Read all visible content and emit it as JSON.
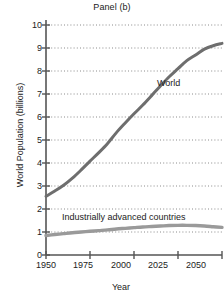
{
  "chart_data": {
    "type": "line",
    "title": "Panel (b)",
    "xlabel": "Year",
    "ylabel": "World Population (billions)",
    "xlim": [
      1950,
      2050
    ],
    "ylim": [
      0,
      10
    ],
    "xticks": [
      1950,
      1975,
      2000,
      2025,
      2050
    ],
    "yticks": [
      0,
      1,
      2,
      3,
      4,
      5,
      6,
      7,
      8,
      9,
      10
    ],
    "grid": "horizontal-dotted",
    "legend": "inline-annotations",
    "series": [
      {
        "name": "World",
        "color": "#6e6e6e",
        "label_x": 2028,
        "label_y": 7.5,
        "x": [
          1950,
          1955,
          1960,
          1965,
          1970,
          1975,
          1980,
          1985,
          1990,
          1995,
          2000,
          2005,
          2010,
          2015,
          2020,
          2025,
          2030,
          2035,
          2040,
          2045,
          2050
        ],
        "values": [
          2.55,
          2.78,
          3.03,
          3.34,
          3.7,
          4.08,
          4.45,
          4.85,
          5.32,
          5.74,
          6.14,
          6.52,
          6.93,
          7.35,
          7.75,
          8.1,
          8.45,
          8.7,
          8.95,
          9.1,
          9.2
        ]
      },
      {
        "name": "Industrially advanced countries",
        "color": "#9a9a9a",
        "label_x": 1968,
        "label_y": 1.85,
        "x": [
          1950,
          1955,
          1960,
          1965,
          1970,
          1975,
          1980,
          1985,
          1990,
          1995,
          2000,
          2005,
          2010,
          2015,
          2020,
          2025,
          2030,
          2035,
          2040,
          2045,
          2050
        ],
        "values": [
          0.85,
          0.89,
          0.93,
          0.97,
          1.0,
          1.03,
          1.06,
          1.09,
          1.13,
          1.16,
          1.19,
          1.22,
          1.24,
          1.26,
          1.28,
          1.29,
          1.29,
          1.28,
          1.26,
          1.23,
          1.2
        ]
      }
    ]
  },
  "axis": {
    "ytick_labels": [
      "10",
      "9",
      "8",
      "7",
      "6",
      "5",
      "4",
      "3",
      "2",
      "1",
      "0"
    ],
    "xtick_labels": [
      "1950",
      "1975",
      "2000",
      "2025",
      "2050"
    ]
  },
  "colors": {
    "axis": "#555555",
    "grid": "#8a8a8a",
    "world_line": "#6e6e6e",
    "iac_line": "#9a9a9a",
    "text": "#222222",
    "background": "#ffffff"
  }
}
